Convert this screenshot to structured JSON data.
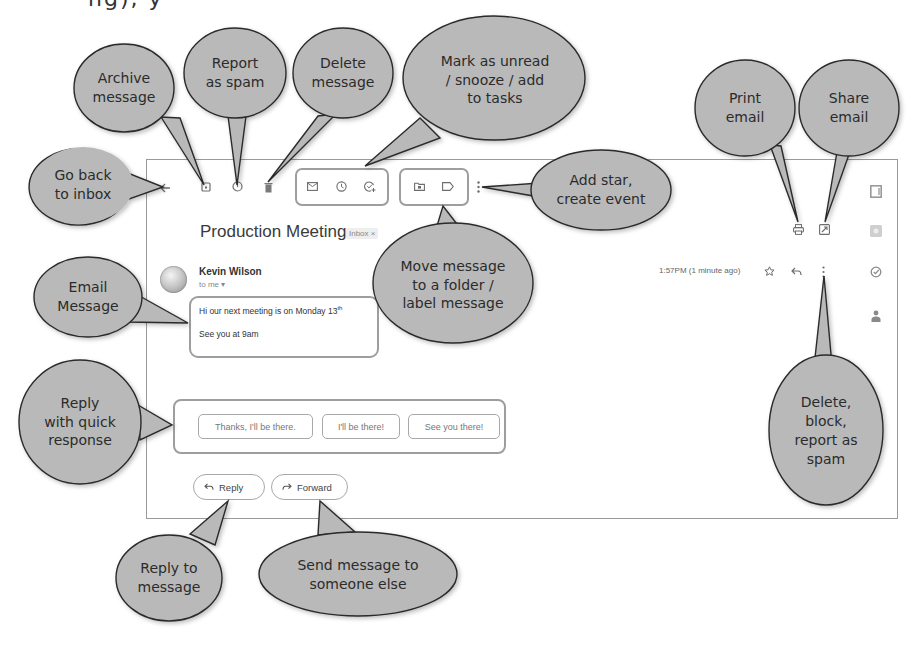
{
  "page": {
    "top_fragment": "ng), y"
  },
  "toolbar": {
    "back": {
      "icon": "arrow-left-icon"
    },
    "archive": {
      "icon": "archive-icon"
    },
    "report_spam": {
      "icon": "report-spam-icon"
    },
    "delete": {
      "icon": "trash-icon"
    },
    "mark_unread": {
      "icon": "envelope-icon"
    },
    "snooze": {
      "icon": "clock-icon"
    },
    "add_to_tasks": {
      "icon": "add-task-icon"
    },
    "move_to": {
      "icon": "folder-move-icon"
    },
    "label": {
      "icon": "label-icon"
    },
    "more": {
      "icon": "more-vertical-icon"
    },
    "print": {
      "icon": "printer-icon"
    },
    "open_new_window": {
      "icon": "open-in-new-icon"
    }
  },
  "side_panel": {
    "items": [
      {
        "icon": "calendar-icon"
      },
      {
        "icon": "keep-icon"
      },
      {
        "icon": "tasks-icon"
      },
      {
        "icon": "contacts-icon"
      }
    ]
  },
  "email": {
    "subject": "Production Meeting",
    "label_badge": "Inbox ×",
    "sender": "Kevin Wilson",
    "to": "to me ▾",
    "timestamp": "1:57PM (1 minute ago)",
    "body_line1": "Hi our next meeting is on Monday 13",
    "body_line1_sup": "th",
    "body_line2": "See you at 9am"
  },
  "quick_replies": [
    "Thanks, I'll be there.",
    "I'll be there!",
    "See you there!"
  ],
  "actions": {
    "reply": "Reply",
    "forward": "Forward"
  },
  "callouts": {
    "go_back": "Go back\nto inbox",
    "archive": "Archive\nmessage",
    "report_spam": "Report\nas spam",
    "delete": "Delete\nmessage",
    "mark_unread": "Mark as unread\n/ snooze / add\nto tasks",
    "add_star": "Add star,\ncreate event",
    "move_label": "Move message\nto a folder /\nlabel message",
    "print": "Print\nemail",
    "share": "Share\nemail",
    "email_message": "Email\nMessage",
    "quick_reply": "Reply\nwith quick\nresponse",
    "more_options": "Delete,\nblock,\nreport as\nspam",
    "reply": "Reply to\nmessage",
    "forward": "Send message to\nsomeone else"
  },
  "colors": {
    "callout_fill": "#b9b9b9",
    "callout_stroke": "#2a2a2a",
    "frame_border": "#9a9a9a",
    "icon": "#6d6d6d"
  }
}
